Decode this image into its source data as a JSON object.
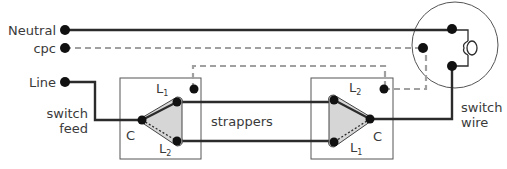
{
  "diagram": {
    "supply_labels": {
      "neutral": "Neutral",
      "cpc": "cpc",
      "line": "Line"
    },
    "annotations": {
      "switch_feed_1": "switch",
      "switch_feed_2": "feed",
      "strappers": "strappers",
      "switch_wire_1": "switch",
      "switch_wire_2": "wire"
    },
    "switch_1": {
      "common": "C",
      "l1": "L",
      "l1_sub": "1",
      "l2": "L",
      "l2_sub": "2"
    },
    "switch_2": {
      "common": "C",
      "l1": "L",
      "l1_sub": "1",
      "l2": "L",
      "l2_sub": "2"
    },
    "colors": {
      "conductor": "#2b2b2b",
      "cpc": "#a0a0a0",
      "switch_fill": "#d6d6d6",
      "box": "#555555",
      "text": "#3a3a3a"
    }
  }
}
